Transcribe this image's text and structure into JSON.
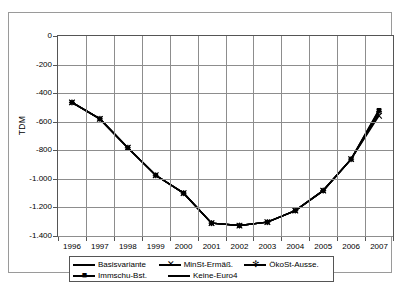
{
  "chart_data": {
    "type": "line",
    "title": "",
    "xlabel": "",
    "ylabel": "TDM",
    "categories": [
      "1996",
      "1997",
      "1998",
      "1999",
      "2000",
      "2001",
      "2002",
      "2003",
      "2004",
      "2005",
      "2006",
      "2007"
    ],
    "ylim": [
      -1400,
      0
    ],
    "xlim_labels": [
      "1996",
      "2007"
    ],
    "yticks": [
      0,
      -200,
      -400,
      -600,
      -800,
      -1000,
      -1200,
      -1400
    ],
    "ytick_labels": [
      "0",
      "-200",
      "-400",
      "-600",
      "-800",
      "-1.000",
      "-1.200",
      "-1.400"
    ],
    "grid": true,
    "legend_position": "bottom",
    "series": [
      {
        "name": "Basisvariante",
        "marker": "line",
        "values": [
          -465,
          -580,
          -782,
          -975,
          -1100,
          -1310,
          -1327,
          -1303,
          -1222,
          -1082,
          -862,
          -515
        ]
      },
      {
        "name": "MinSt-Ermäß.",
        "marker": "x",
        "values": [
          -465,
          -580,
          -782,
          -975,
          -1100,
          -1310,
          -1327,
          -1303,
          -1222,
          -1082,
          -862,
          -558
        ]
      },
      {
        "name": "ÖkoSt-Ausse.",
        "marker": "star",
        "values": [
          -465,
          -580,
          -782,
          -975,
          -1100,
          -1310,
          -1327,
          -1303,
          -1222,
          -1082,
          -862,
          -530
        ]
      },
      {
        "name": "Immschu-Bst.",
        "marker": "square",
        "values": [
          -465,
          -580,
          -782,
          -975,
          -1100,
          -1310,
          -1327,
          -1303,
          -1222,
          -1082,
          -862,
          -520
        ]
      },
      {
        "name": "Keine-Euro4",
        "marker": "line",
        "values": [
          -465,
          -580,
          -782,
          -975,
          -1100,
          -1310,
          -1327,
          -1303,
          -1222,
          -1082,
          -862,
          -545
        ]
      }
    ],
    "colors": {
      "line": "#000000",
      "grid": "#8d8d8d",
      "axis": "#555555",
      "background": "#ffffff"
    }
  },
  "legend": {
    "rows": [
      [
        {
          "label": "Basisvariante",
          "marker": ""
        },
        {
          "label": "MinSt-Ermäß.",
          "marker": "✕"
        },
        {
          "label": "ÖkoSt-Ausse.",
          "marker": "✻"
        }
      ],
      [
        {
          "label": "Immschu-Bst.",
          "marker": "■"
        },
        {
          "label": "Keine-Euro4",
          "marker": ""
        }
      ]
    ]
  }
}
